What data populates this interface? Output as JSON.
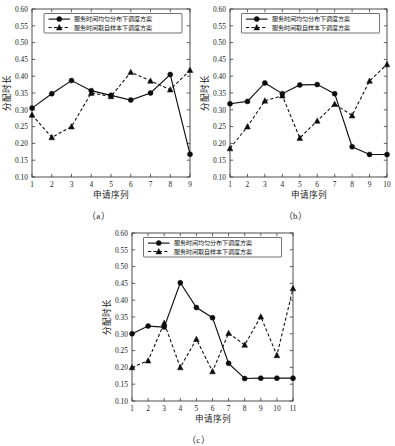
{
  "figure": {
    "background": "#ffffff",
    "ink_color": "#111111",
    "panel_count": 3
  },
  "legend": {
    "series1_label": "服务时间均匀分布下调度方案",
    "series2_label": "服务时间取自样本下调度方案",
    "series1_marker": "circle-marker",
    "series2_marker": "triangle-marker",
    "series1_linestyle": "solid",
    "series2_linestyle": "dashed",
    "position": "upper-center"
  },
  "axis": {
    "xlabel": "申请序列",
    "ylabel": "分配时长",
    "yticks": [
      "0.10",
      "0.15",
      "0.20",
      "0.25",
      "0.30",
      "0.35",
      "0.40",
      "0.45",
      "0.50",
      "0.55",
      "0.60"
    ],
    "ylim": [
      0.1,
      0.6
    ]
  },
  "captions": {
    "a": "（a）",
    "b": "（b）",
    "c": "（c）"
  },
  "chart_data": [
    {
      "id": "panel-a",
      "type": "line",
      "title": "",
      "caption": "（a）",
      "xlabel": "申请序列",
      "ylabel": "分配时长",
      "x": [
        1,
        2,
        3,
        4,
        5,
        6,
        7,
        8,
        9
      ],
      "categories": [
        "1",
        "2",
        "3",
        "4",
        "5",
        "6",
        "7",
        "8",
        "9"
      ],
      "xlim": [
        1,
        9
      ],
      "ylim": [
        0.1,
        0.6
      ],
      "yticks": [
        0.1,
        0.15,
        0.2,
        0.25,
        0.3,
        0.35,
        0.4,
        0.45,
        0.5,
        0.55,
        0.6
      ],
      "grid": false,
      "legend_position": "upper-center",
      "series": [
        {
          "name": "服务时间均匀分布下调度方案",
          "marker": "circle",
          "linestyle": "solid",
          "values": [
            0.305,
            0.348,
            0.387,
            0.357,
            0.343,
            0.329,
            0.35,
            0.405,
            0.168
          ]
        },
        {
          "name": "服务时间取自样本下调度方案",
          "marker": "triangle",
          "linestyle": "dashed",
          "values": [
            0.285,
            0.218,
            0.25,
            0.35,
            0.34,
            0.412,
            0.386,
            0.36,
            0.418
          ]
        }
      ]
    },
    {
      "id": "panel-b",
      "type": "line",
      "title": "",
      "caption": "（b）",
      "xlabel": "申请序列",
      "ylabel": "分配时长",
      "x": [
        1,
        2,
        3,
        4,
        5,
        6,
        7,
        8,
        9,
        10
      ],
      "categories": [
        "1",
        "2",
        "3",
        "4",
        "5",
        "6",
        "7",
        "8",
        "9",
        "10"
      ],
      "xlim": [
        1,
        10
      ],
      "ylim": [
        0.1,
        0.6
      ],
      "yticks": [
        0.1,
        0.15,
        0.2,
        0.25,
        0.3,
        0.35,
        0.4,
        0.45,
        0.5,
        0.55,
        0.6
      ],
      "grid": false,
      "legend_position": "upper-center",
      "series": [
        {
          "name": "服务时间均匀分布下调度方案",
          "marker": "circle",
          "linestyle": "solid",
          "values": [
            0.318,
            0.325,
            0.38,
            0.348,
            0.374,
            0.375,
            0.348,
            0.19,
            0.167,
            0.167
          ]
        },
        {
          "name": "服务时间取自样本下调度方案",
          "marker": "triangle",
          "linestyle": "dashed",
          "values": [
            0.185,
            0.25,
            0.327,
            0.342,
            0.216,
            0.267,
            0.317,
            0.283,
            0.386,
            0.435
          ]
        }
      ]
    },
    {
      "id": "panel-c",
      "type": "line",
      "title": "",
      "caption": "（c）",
      "xlabel": "申请序列",
      "ylabel": "分配时长",
      "x": [
        1,
        2,
        3,
        4,
        5,
        6,
        7,
        8,
        9,
        10,
        11
      ],
      "categories": [
        "1",
        "2",
        "3",
        "4",
        "5",
        "6",
        "7",
        "8",
        "9",
        "10",
        "11"
      ],
      "xlim": [
        1,
        11
      ],
      "ylim": [
        0.1,
        0.6
      ],
      "yticks": [
        0.1,
        0.15,
        0.2,
        0.25,
        0.3,
        0.35,
        0.4,
        0.45,
        0.5,
        0.55,
        0.6
      ],
      "grid": false,
      "legend_position": "upper-center",
      "series": [
        {
          "name": "服务时间均匀分布下调度方案",
          "marker": "circle",
          "linestyle": "solid",
          "values": [
            0.3,
            0.323,
            0.32,
            0.452,
            0.378,
            0.348,
            0.212,
            0.167,
            0.168,
            0.168,
            0.168
          ]
        },
        {
          "name": "服务时间取自样本下调度方案",
          "marker": "triangle",
          "linestyle": "dashed",
          "values": [
            0.2,
            0.22,
            0.332,
            0.2,
            0.284,
            0.188,
            0.302,
            0.267,
            0.351,
            0.236,
            0.435
          ]
        }
      ]
    }
  ]
}
